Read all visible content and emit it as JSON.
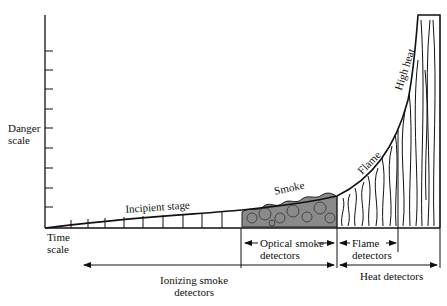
{
  "diagram": {
    "y_axis": {
      "label_line1": "Danger",
      "label_line2": "scale"
    },
    "x_axis": {
      "label_line1": "Time",
      "label_line2": "scale"
    },
    "curve_labels": {
      "incipient": "Incipient stage",
      "smoke": "Smoke",
      "flame": "Flame",
      "high_heat": "High heat"
    },
    "detectors": {
      "optical_line1": "Optical smoke",
      "optical_line2": "detectors",
      "flame_line1": "Flame",
      "flame_line2": "detectors",
      "ionizing_line1": "Ionizing smoke",
      "ionizing_line2": "detectors",
      "heat": "Heat detectors"
    },
    "colors": {
      "ink": "#111111",
      "smoke_fill": "#8a8a8a",
      "background": "#ffffff"
    }
  }
}
